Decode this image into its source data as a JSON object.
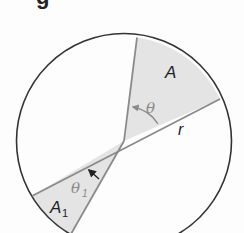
{
  "heading_fragment": "g",
  "diagram": {
    "type": "circle-sectors",
    "colors": {
      "circle_stroke": "#333333",
      "sector_fill": "#e4e4e4",
      "sector_stroke": "#8a8a8a",
      "label_dark": "#222222",
      "label_grey": "#8a8a8a"
    },
    "labels": {
      "sector_area": "A",
      "sector_angle": "θ",
      "radius": "r",
      "small_sector_angle": "θ",
      "small_sector_angle_sub": "1",
      "small_sector_area": "A",
      "small_sector_area_sub": "1"
    }
  }
}
